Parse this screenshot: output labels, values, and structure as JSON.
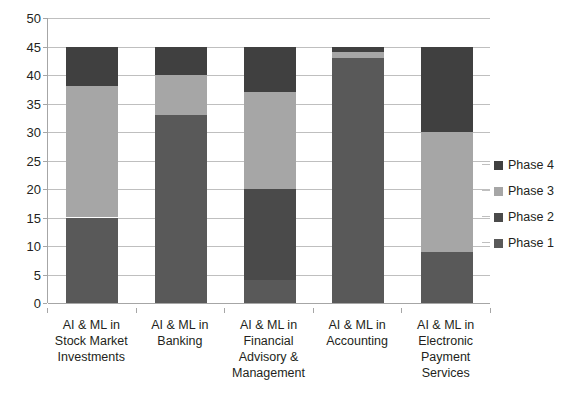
{
  "chart_data": {
    "type": "bar",
    "subtype": "stacked-column",
    "title": "",
    "xlabel": "",
    "ylabel": "",
    "ylim": [
      0,
      50
    ],
    "ytick_step": 5,
    "yticks": [
      0,
      5,
      10,
      15,
      20,
      25,
      30,
      35,
      40,
      45,
      50
    ],
    "grid": true,
    "legend_position": "right",
    "categories": [
      "AI & ML in Stock Market Investments",
      "AI & ML in Banking",
      "AI & ML in Financial Advisory & Management",
      "AI & ML in Accounting",
      "AI  & ML in Electronic Payment Services"
    ],
    "category_lines": [
      [
        "AI & ML in",
        "Stock Market",
        "Investments"
      ],
      [
        "AI & ML in",
        "Banking"
      ],
      [
        "AI & ML in",
        "Financial",
        "Advisory &",
        "Management"
      ],
      [
        "AI & ML in",
        "Accounting"
      ],
      [
        "AI  & ML in",
        "Electronic",
        "Payment",
        "Services"
      ]
    ],
    "series": [
      {
        "name": "Phase 1",
        "color": "#595959",
        "values": [
          15,
          33,
          4,
          43,
          9
        ]
      },
      {
        "name": "Phase 2",
        "color": "#4a4a4a",
        "values": [
          0,
          0,
          16,
          0,
          0
        ]
      },
      {
        "name": "Phase 3",
        "color": "#a6a6a6",
        "values": [
          23,
          7,
          17,
          1,
          21
        ]
      },
      {
        "name": "Phase 4",
        "color": "#404040",
        "values": [
          7,
          5,
          8,
          1,
          15
        ]
      }
    ],
    "series_totals": [
      45,
      45,
      45,
      45,
      45
    ],
    "legend_order": [
      "Phase 4",
      "Phase 3",
      "Phase 2",
      "Phase 1"
    ]
  },
  "legend": {
    "items": [
      {
        "label": "Phase 4",
        "color": "#404040"
      },
      {
        "label": "Phase 3",
        "color": "#a6a6a6"
      },
      {
        "label": "Phase 2",
        "color": "#4a4a4a"
      },
      {
        "label": "Phase 1",
        "color": "#595959"
      }
    ]
  },
  "axis": {
    "y_tick_labels": [
      "50",
      "45",
      "40",
      "35",
      "30",
      "25",
      "20",
      "15",
      "10",
      "5",
      "0"
    ]
  }
}
